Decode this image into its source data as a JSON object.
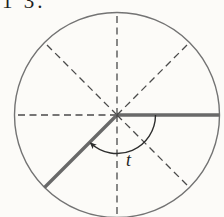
{
  "page": {
    "background": "#fcfbf8"
  },
  "caption_fragment": {
    "text": "1 3."
  },
  "figure": {
    "circle": {
      "cx": 117,
      "cy": 115,
      "r": 102.5,
      "color": "#737373",
      "stroke_width": 1.4
    },
    "spokes": [
      {
        "dir": "east",
        "angle_deg": 0,
        "style": "solid"
      },
      {
        "dir": "northeast",
        "angle_deg": 45,
        "style": "dashed"
      },
      {
        "dir": "north",
        "angle_deg": 90,
        "style": "dashed"
      },
      {
        "dir": "northwest",
        "angle_deg": 135,
        "style": "dashed"
      },
      {
        "dir": "west",
        "angle_deg": 180,
        "style": "dashed"
      },
      {
        "dir": "southwest",
        "angle_deg": 225,
        "style": "solid"
      },
      {
        "dir": "south",
        "angle_deg": 270,
        "style": "dashed"
      },
      {
        "dir": "southeast",
        "angle_deg": 315,
        "style": "dashed"
      }
    ],
    "solid_style": {
      "color": "#696969",
      "width": 3.4
    },
    "dashed_style": {
      "color": "#4a4a4a",
      "width": 1.3,
      "pattern": "7 4.5"
    },
    "angle_arc": {
      "radius": 38.5,
      "start_deg": 0,
      "end_deg": -133,
      "color": "#2d2d2d",
      "width": 1.4,
      "arrow_at": "end"
    },
    "angle_label": {
      "text": "t"
    }
  }
}
